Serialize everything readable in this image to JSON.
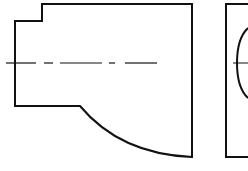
{
  "drawing": {
    "type": "orthographic-projection",
    "views": [
      {
        "name": "front-view",
        "outline_color": "#111111",
        "centerline_color": "#111111",
        "outline_path": "M42 4 L192 4 L192 157 Q120 154 80 106 L15 106 L15 21 L42 21 Z",
        "centerline": {
          "y": 63,
          "segments": [
            [
              6,
              36
            ],
            [
              44,
              53
            ],
            [
              60,
              102
            ],
            [
              109,
              115
            ],
            [
              125,
              157
            ]
          ]
        }
      },
      {
        "name": "side-view",
        "outline_color": "#111111",
        "outline_path": "M248 4 L226 4 L226 157 L248 157",
        "circle_arc_path": "M248 28 Q237 38 237 63 Q237 88 248 98",
        "centerline": {
          "y": 63,
          "x1": 233,
          "x2": 248
        }
      }
    ]
  }
}
